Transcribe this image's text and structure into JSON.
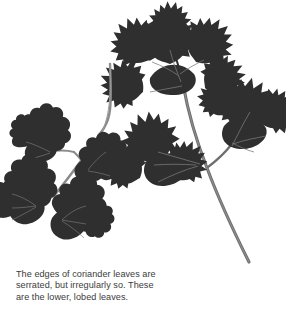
{
  "image": {
    "subject": "coriander-leaves",
    "background_color": "#ffffff",
    "leaf_color": "#2f2f2f",
    "leaf_color_dark": "#1f1f1f",
    "stem_color": "#6e6e6e",
    "stem_color_light": "#8a8a8a"
  },
  "caption": {
    "text": "The edges of coriander leaves are\nserrated, but irregularly so. These\nare the lower, lobed leaves.",
    "line1": "The edges of coriander leaves are",
    "line2": "serrated, but irregularly so. These",
    "line3": "are the lower, lobed leaves.",
    "color": "#3b3b3b"
  },
  "specimens": [
    {
      "name": "left-sprig",
      "description": "smaller coriander sprig with rounded, shallowly lobed leaflets",
      "leaflet_count": 4
    },
    {
      "name": "right-sprig",
      "description": "larger coriander sprig with deeply serrated compound leaves on a long stem",
      "leaflet_count": 3
    }
  ]
}
